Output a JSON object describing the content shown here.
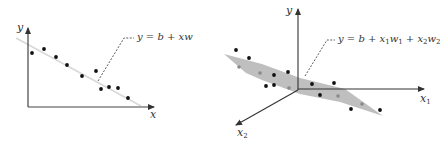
{
  "left_plot": {
    "title": "Simple linear regression",
    "y_axis_label": "y",
    "x_axis_label": "x",
    "equation": "y = b + xw",
    "line_color": "#d9d9d9",
    "axis_color": "#444444",
    "points": [
      [
        32,
        53
      ],
      [
        44,
        49
      ],
      [
        56,
        57
      ],
      [
        67,
        65
      ],
      [
        82,
        76
      ],
      [
        96,
        71
      ],
      [
        101,
        89
      ],
      [
        109,
        87
      ],
      [
        118,
        88
      ],
      [
        128,
        98
      ]
    ]
  },
  "right_plot": {
    "title": "Multiple linear regression",
    "y_axis_label": "y",
    "x1_axis_label": "x",
    "x1_sub": "1",
    "x2_axis_label": "x",
    "x2_sub": "2",
    "equation_parts": {
      "prefix": "y = b + x",
      "sub1": "1",
      "mid1": "w",
      "sub2": "1",
      "mid2": " + x",
      "sub3": "2",
      "mid3": "w",
      "sub4": "2"
    },
    "plane_color": "#b8b8b8",
    "axis_color": "#333333",
    "black_points": [
      [
        236,
        50
      ],
      [
        249,
        58
      ],
      [
        274,
        75
      ],
      [
        288,
        72
      ],
      [
        266,
        86
      ],
      [
        274,
        85
      ],
      [
        312,
        84
      ],
      [
        334,
        83
      ],
      [
        320,
        95
      ],
      [
        351,
        109
      ],
      [
        380,
        110
      ]
    ],
    "gray_points": [
      [
        239,
        67
      ],
      [
        260,
        73
      ],
      [
        289,
        88
      ],
      [
        338,
        96
      ],
      [
        362,
        104
      ]
    ]
  }
}
